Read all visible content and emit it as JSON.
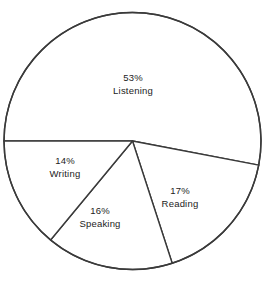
{
  "chart_data": {
    "type": "pie",
    "title": "",
    "subtitle": "",
    "xlabel": "",
    "ylabel": "",
    "legend": "none",
    "grid": false,
    "units": "percent",
    "total": 100,
    "start_angle_deg": 180,
    "direction": "clockwise",
    "categories": [
      "Listening",
      "Reading",
      "Speaking",
      "Writing"
    ],
    "values": [
      53,
      17,
      16,
      14
    ],
    "slices": [
      {
        "name": "Listening",
        "value": 53,
        "percent_label": "53%",
        "name_label": "Listening",
        "sweep_deg": 190.8,
        "start_deg": 180,
        "end_deg": 370.8,
        "label_x": 133,
        "label_y": 84,
        "fill": "#ffffff",
        "stroke": "#3a3a3a"
      },
      {
        "name": "Reading",
        "value": 17,
        "percent_label": "17%",
        "name_label": "Reading",
        "sweep_deg": 61.2,
        "start_deg": 370.8,
        "end_deg": 432,
        "label_x": 180,
        "label_y": 197,
        "fill": "#ffffff",
        "stroke": "#3a3a3a"
      },
      {
        "name": "Speaking",
        "value": 16,
        "percent_label": "16%",
        "name_label": "Speaking",
        "sweep_deg": 57.6,
        "start_deg": 432,
        "end_deg": 489.6,
        "label_x": 100,
        "label_y": 217,
        "fill": "#ffffff",
        "stroke": "#3a3a3a"
      },
      {
        "name": "Writing",
        "value": 14,
        "percent_label": "14%",
        "name_label": "Writing",
        "sweep_deg": 50.4,
        "start_deg": 489.6,
        "end_deg": 540,
        "label_x": 65,
        "label_y": 167,
        "fill": "#ffffff",
        "stroke": "#3a3a3a"
      }
    ],
    "geometry": {
      "center_x": 132.5,
      "center_y": 141,
      "radius": 128.5
    },
    "colors": {
      "background": "#ffffff",
      "outline": "#3a3a3a",
      "text": "#1c1c1c"
    }
  }
}
